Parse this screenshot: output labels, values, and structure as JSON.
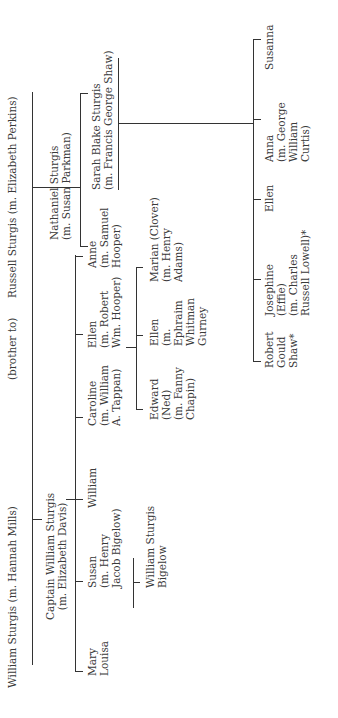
{
  "generation1": {
    "william": "William Sturgis (m. Hannah Mills)",
    "relation": "(brother to)",
    "russell": "Russell Sturgis (m. Elizabeth Perkins)"
  },
  "generation2": {
    "captain": "Captain William Sturgis\n(m. Elizabeth Davis)",
    "nathaniel": "Nathaniel Sturgis\n(m. Susan Parkman)",
    "sarah": "Sarah Blake Sturgis\n(m. Francis George Shaw)"
  },
  "captain_children": [
    {
      "name": "Mary\nLouisa"
    },
    {
      "name": "Susan\n(m. Henry\nJacob Bigelow)"
    },
    {
      "name": "William"
    },
    {
      "name": "Caroline\n(m. William\nA. Tappan)"
    },
    {
      "name": "Ellen\n(m. Robert\nWm. Hooper)"
    },
    {
      "name": "Anne\n(m. Samuel\nHooper)"
    }
  ],
  "bigelow_children": [
    {
      "name": "William Sturgis\nBigelow"
    }
  ],
  "hooper_children": [
    {
      "name": "Edward\n(Ned)\n(m. Fanny\nChapin)"
    },
    {
      "name": "Ellen\n(m.\nEphraim\nWhitman\nGurney"
    },
    {
      "name": "Marian (Clover)\n(m. Henry\nAdams)"
    }
  ],
  "shaw_children": [
    {
      "name": "Robert\nGould\nShaw*"
    },
    {
      "name": "Josephine\n(Effie)\n(m. Charles\nRussell Lowell)*"
    },
    {
      "name": "Ellen"
    },
    {
      "name": "Anna\n(m. George\nWilliam\nCurtis)"
    },
    {
      "name": "Susanna"
    }
  ]
}
